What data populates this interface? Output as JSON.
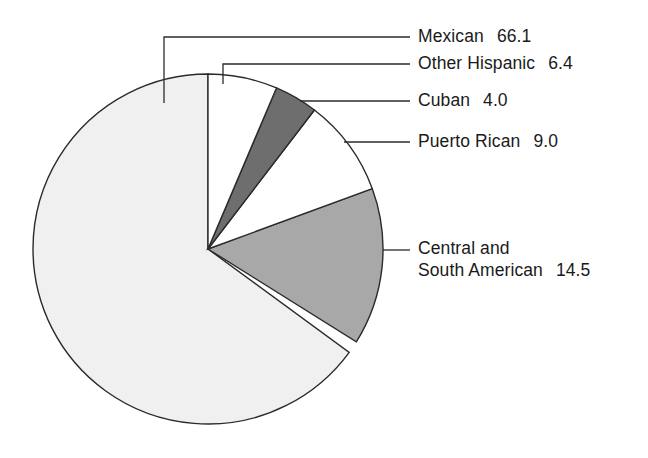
{
  "chart_data": {
    "type": "pie",
    "title": "",
    "subtitle": "",
    "xlabel": "",
    "ylabel": "",
    "legend_position": "right-callouts",
    "grid": false,
    "units": "percent",
    "total": 100.0,
    "categories": [
      "Mexican",
      "Other Hispanic",
      "Cuban",
      "Puerto Rican",
      "Central and South American"
    ],
    "values": [
      66.1,
      6.4,
      4.0,
      9.0,
      14.5
    ],
    "value_labels": [
      "66.1",
      "6.4",
      "4.0",
      "9.0",
      "14.5"
    ],
    "slices": [
      {
        "name": "Mexican",
        "value": 66.1,
        "value_label": "66.1",
        "color": "#f0f0f0",
        "start_angle": 126.2,
        "end_angle": 360.0
      },
      {
        "name": "Other Hispanic",
        "value": 6.4,
        "value_label": "6.4",
        "color": "#ffffff",
        "start_angle": 0.0,
        "end_angle": 23.04
      },
      {
        "name": "Cuban",
        "value": 4.0,
        "value_label": "4.0",
        "color": "#6e6e6e",
        "start_angle": 23.04,
        "end_angle": 37.44
      },
      {
        "name": "Puerto Rican",
        "value": 9.0,
        "value_label": "9.0",
        "color": "#ffffff",
        "start_angle": 37.44,
        "end_angle": 69.84
      },
      {
        "name": "Central and South American",
        "value": 14.5,
        "value_label": "14.5",
        "color": "#a8a8a8",
        "start_angle": 69.84,
        "end_angle": 122.04
      }
    ]
  },
  "labels": {
    "mexican": {
      "name": "Mexican",
      "value": "66.1"
    },
    "other_hispanic": {
      "name": "Other Hispanic",
      "value": "6.4"
    },
    "cuban": {
      "name": "Cuban",
      "value": "4.0"
    },
    "puerto_rican": {
      "name": "Puerto Rican",
      "value": "9.0"
    },
    "central_south": {
      "name_line1": "Central and",
      "name_line2": "South American",
      "value": "14.5"
    }
  },
  "colors": {
    "mexican": "#f0f0f0",
    "other_hispanic": "#ffffff",
    "cuban": "#6e6e6e",
    "puerto_rican": "#ffffff",
    "central_south": "#a8a8a8",
    "outline": "#2b2b2b",
    "background": "#ffffff"
  }
}
